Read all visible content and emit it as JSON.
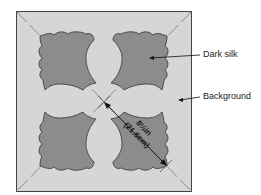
{
  "diagram": {
    "colors": {
      "background_fill": "#d6d6d6",
      "silk_fill": "#8c8c8c",
      "outline": "#333333",
      "guide": "#888888"
    },
    "labels": {
      "dark_silk": "Dark silk",
      "background": "Background"
    },
    "dimension": {
      "imperial": "8½in",
      "metric": "(21.6cm)"
    }
  }
}
